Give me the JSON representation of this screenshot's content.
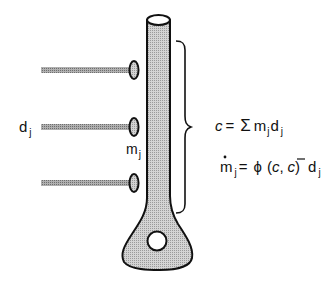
{
  "diagram": {
    "labels": {
      "dj_left": {
        "base": "d",
        "sub": "j"
      },
      "mj": {
        "base": "m",
        "sub": "j"
      },
      "eq1": {
        "lhs": "c",
        "eq": "=",
        "sum": "Σ",
        "m": "m",
        "msub": "j",
        "d": "d",
        "dsub": "j"
      },
      "eq2": {
        "m": "m",
        "msub": "j",
        "eq": "=",
        "phi": "ϕ",
        "open": "(",
        "c": "c",
        "comma": ",",
        "cbar": "c",
        "close": ")",
        "d": "d",
        "dsub": "j"
      }
    },
    "synapses": [
      {
        "y": 70
      },
      {
        "y": 127
      },
      {
        "y": 183
      }
    ],
    "colors": {
      "stroke": "#111111",
      "fill_shaded": "#c8c8c8",
      "fill_rod": "#a0a0a0",
      "background": "#ffffff"
    }
  }
}
